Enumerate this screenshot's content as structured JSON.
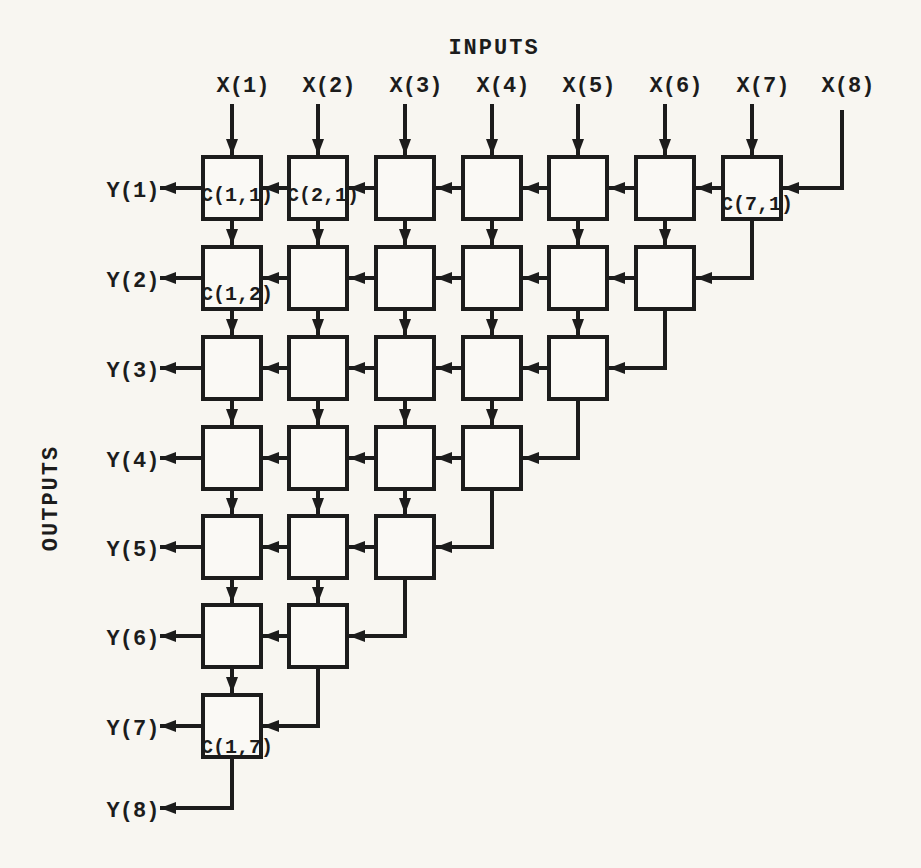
{
  "titles": {
    "inputs": "INPUTS",
    "outputs": "OUTPUTS"
  },
  "inputs": [
    "X(1)",
    "X(2)",
    "X(3)",
    "X(4)",
    "X(5)",
    "X(6)",
    "X(7)",
    "X(8)"
  ],
  "outputs": [
    "Y(1)",
    "Y(2)",
    "Y(3)",
    "Y(4)",
    "Y(5)",
    "Y(6)",
    "Y(7)",
    "Y(8)"
  ],
  "cell_labels": [
    {
      "row": 1,
      "col": 1,
      "text": "C(1,1)",
      "valign": "mid"
    },
    {
      "row": 1,
      "col": 2,
      "text": "C(2,1)",
      "valign": "mid"
    },
    {
      "row": 1,
      "col": 7,
      "text": "C(7,1)",
      "valign": "low"
    },
    {
      "row": 2,
      "col": 1,
      "text": "C(1,2)",
      "valign": "low"
    },
    {
      "row": 7,
      "col": 1,
      "text": "C(1,7)",
      "valign": "bottom"
    }
  ],
  "grid": {
    "rows": 7,
    "row_cells": [
      7,
      6,
      5,
      4,
      3,
      2,
      1
    ],
    "col_centers": [
      232,
      318,
      405,
      492,
      578,
      665,
      752
    ],
    "row_centers": [
      188,
      278,
      368,
      458,
      547,
      636,
      726
    ],
    "box_w": 58,
    "box_h": 62,
    "x8_channel_x": 842,
    "y8_row_y": 808,
    "input_arrow_top": 104,
    "input_label_baseline": 92,
    "output_tip_x": 160,
    "output_label_x": 133,
    "inputs_title_x": 494,
    "inputs_title_y": 54,
    "outputs_title_x": 57,
    "outputs_title_y": 498
  },
  "colors": {
    "ink": "#1c1c1c",
    "paper": "#f8f6f1"
  }
}
